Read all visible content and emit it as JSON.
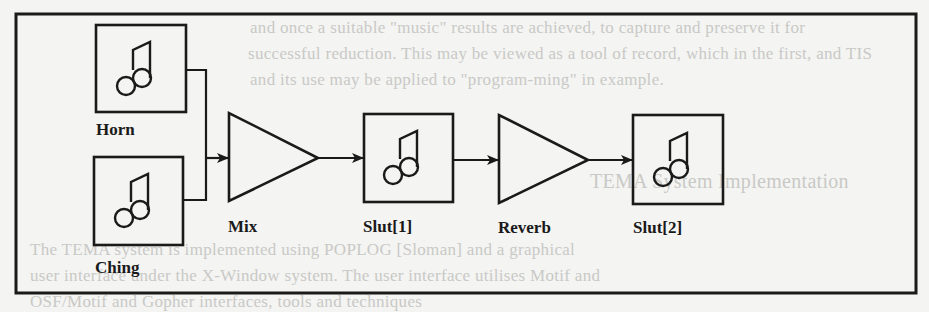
{
  "figure": {
    "type": "signal-flow patch diagram",
    "stroke_color": "#1a1a1a",
    "background_color": "#f4f4f2",
    "nodes": [
      {
        "id": "horn",
        "kind": "sound-source",
        "icon": "music-note-icon",
        "label": "Horn"
      },
      {
        "id": "ching",
        "kind": "sound-source",
        "icon": "music-note-icon",
        "label": "Ching"
      },
      {
        "id": "mix",
        "kind": "amplifier-triangle",
        "label": "Mix"
      },
      {
        "id": "slut1",
        "kind": "sound-slot",
        "icon": "music-note-icon",
        "label": "Slut[1]"
      },
      {
        "id": "reverb",
        "kind": "amplifier-triangle",
        "label": "Reverb"
      },
      {
        "id": "slut2",
        "kind": "sound-slot",
        "icon": "music-note-icon",
        "label": "Slut[2]"
      }
    ],
    "edges": [
      {
        "from": "Horn",
        "to": "Mix"
      },
      {
        "from": "Ching",
        "to": "Mix"
      },
      {
        "from": "Mix",
        "to": "Slut[1]"
      },
      {
        "from": "Slut[1]",
        "to": "Reverb"
      },
      {
        "from": "Reverb",
        "to": "Slut[2]"
      }
    ]
  },
  "bleed_through_text": {
    "lines": [
      "and once a suitable \"music\" results are achieved, to capture and preserve it for",
      "successful reduction. This may be viewed as a tool of record, which in the first, and TIS",
      "and its use may be applied to \"program-ming\" in example.",
      "TEMA System Implementation",
      "The TEMA system is implemented using POPLOG [Sloman] and a graphical",
      "user interface under the X-Window system. The user interface utilises Motif and",
      "OSF/Motif and Gopher interfaces, tools and techniques"
    ]
  }
}
